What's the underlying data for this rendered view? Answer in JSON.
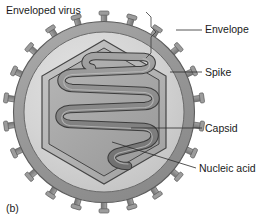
{
  "figure": {
    "title": "Enveloped virus",
    "panel_letter": "(b)",
    "background_color": "#ffffff",
    "text_color": "#1a1a1a"
  },
  "labels": [
    {
      "id": "envelope",
      "text": "Envelope",
      "x": 205,
      "y": 33,
      "leader_from": [
        202,
        30
      ],
      "leader_to": [
        176,
        30
      ]
    },
    {
      "id": "spike",
      "text": "Spike",
      "x": 205,
      "y": 76,
      "leader_from": [
        202,
        72
      ],
      "leader_to": [
        170,
        72
      ]
    },
    {
      "id": "capsid",
      "text": "Capsid",
      "x": 205,
      "y": 132,
      "leader_from": [
        202,
        128
      ],
      "leader_to": [
        131,
        128
      ]
    },
    {
      "id": "nucleic_acid",
      "text": "Nucleic acid",
      "x": 199,
      "y": 172,
      "leader_from": [
        196,
        168
      ],
      "leader_to": [
        112,
        142
      ]
    }
  ],
  "bracket": {
    "id": "envelope-bracket",
    "description": "angular bracket spanning the envelope ring",
    "points": "146,12 151,17 151,27 156,32 151,37 151,53 146,58"
  },
  "structure": {
    "center": {
      "x": 104,
      "y": 112
    },
    "envelope_outer_radius": 91,
    "envelope_inner_radius": 80,
    "interior_radius": 80,
    "capsid_hexagon_outer_radius": 72,
    "capsid_hexagon_inner_radius": 66,
    "spike_count": 22,
    "nucleic_acid_loops": 5
  },
  "colors": {
    "envelope_ring": "#9a9a9a",
    "envelope_ring_edge": "#6e6e6e",
    "interior_fill": "#d2d2d2",
    "capsid_outer_fill": "#b5b5b5",
    "capsid_inner_fill": "#a8a8a8",
    "capsid_stroke": "#4a4a4a",
    "spike_fill": "#8f8f8f",
    "spike_stroke": "#5a5a5a",
    "nucleic_acid_fill": "#8a8a8a",
    "nucleic_acid_stroke": "#3c3c3c",
    "outline": "#4a4a4a"
  }
}
